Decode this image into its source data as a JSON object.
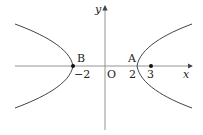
{
  "diagram": {
    "type": "hyperbola",
    "axes": {
      "x_label": "x",
      "y_label": "y",
      "origin_label": "O"
    },
    "points": [
      {
        "name": "B",
        "tick": "−2",
        "x": -2
      },
      {
        "name": "A",
        "tick": "2",
        "x": 2
      },
      {
        "name": "",
        "tick": "3",
        "x": 3
      }
    ],
    "colors": {
      "stroke": "#444444",
      "text": "#222222"
    }
  }
}
